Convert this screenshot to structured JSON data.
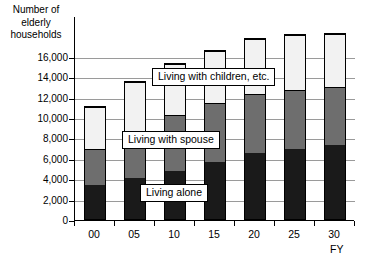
{
  "chart_data": {
    "type": "bar",
    "stacked": true,
    "title": "",
    "ylabel": "Number of\nelderly\nhouseholds",
    "xlabel": "FY",
    "categories": [
      "00",
      "05",
      "10",
      "15",
      "20",
      "25",
      "30"
    ],
    "ylim": [
      0,
      16000
    ],
    "ytick_values": [
      0,
      2000,
      4000,
      6000,
      8000,
      10000,
      12000,
      14000,
      16000
    ],
    "ytick_labels": [
      "0",
      "2,000",
      "4,000",
      "6,000",
      "8,000",
      "10,000",
      "12,000",
      "14,000",
      "16,000"
    ],
    "grid": true,
    "legend_position": "inline-callouts",
    "series": [
      {
        "name": "Living alone",
        "color": "#1a1a1a",
        "values": [
          3400,
          4100,
          4800,
          5700,
          6500,
          6900,
          7300
        ]
      },
      {
        "name": "Living with spouse",
        "color": "#6e6e6e",
        "values": [
          3600,
          4600,
          5500,
          5800,
          5900,
          5900,
          5800
        ]
      },
      {
        "name": "Living with children, etc.",
        "color": "#f2f2f2",
        "values": [
          4200,
          4900,
          5100,
          5200,
          5400,
          5400,
          5200
        ]
      }
    ],
    "totals": [
      11200,
      13600,
      15400,
      16700,
      17800,
      18200,
      18300
    ],
    "annotations": [
      {
        "text": "Living with children, etc.",
        "x_px": 152,
        "y_px": 68
      },
      {
        "text": "Living with spouse",
        "x_px": 122,
        "y_px": 131
      },
      {
        "text": "Living alone",
        "x_px": 140,
        "y_px": 184
      }
    ]
  },
  "axis": {
    "y_title": "Number of elderly households",
    "y_title_lines": [
      "Number of",
      "elderly",
      "households"
    ],
    "x_title": "FY"
  },
  "footnote": {
    "clipped_text": ""
  }
}
